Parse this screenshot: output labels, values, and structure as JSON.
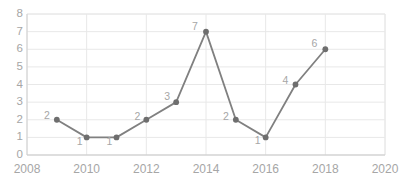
{
  "chart_data": {
    "type": "line",
    "title": "",
    "subtitle": "",
    "xlabel": "",
    "ylabel": "",
    "x": [
      2009,
      2010,
      2011,
      2012,
      2013,
      2014,
      2015,
      2016,
      2017,
      2018
    ],
    "values": [
      2,
      1,
      1,
      2,
      3,
      7,
      2,
      1,
      4,
      6
    ],
    "point_labels": [
      "2",
      "1",
      "1",
      "2",
      "3",
      "7",
      "2",
      "1",
      "4",
      "6"
    ],
    "xlim": [
      2008,
      2020
    ],
    "ylim": [
      0,
      8
    ],
    "x_ticks": [
      2008,
      2010,
      2012,
      2014,
      2016,
      2018,
      2020
    ],
    "x_tick_labels": [
      "2008",
      "2010",
      "2012",
      "2014",
      "2016",
      "2018",
      "2020"
    ],
    "y_ticks": [
      0,
      1,
      2,
      3,
      4,
      5,
      6,
      7,
      8
    ],
    "y_tick_labels": [
      "0",
      "1",
      "2",
      "3",
      "4",
      "5",
      "6",
      "7",
      "8"
    ],
    "grid": {
      "horizontal": true,
      "vertical": true
    },
    "legend": {
      "visible": false,
      "position": "none"
    },
    "series": [
      {
        "name": "",
        "x": [
          2009,
          2010,
          2011,
          2012,
          2013,
          2014,
          2015,
          2016,
          2017,
          2018
        ],
        "values": [
          2,
          1,
          1,
          2,
          3,
          7,
          2,
          1,
          4,
          6
        ],
        "line_color": "#808080",
        "marker_color": "#6e6e6e",
        "marker": "circle"
      }
    ],
    "colors": {
      "line": "#808080",
      "marker": "#6e6e6e",
      "grid": "#e8e8e8",
      "axis": "#d9d9d9",
      "tick_text": "#a6a6a6",
      "data_label_text": "#a6a6a6",
      "background": "#ffffff"
    }
  }
}
